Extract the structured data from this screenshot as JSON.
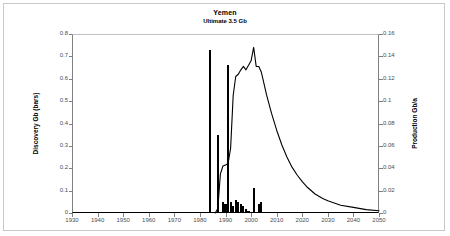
{
  "chart": {
    "title": "Yemen",
    "subtitle": "Ultimate 3.5 Gb",
    "ylabel_left": "Discovery Gb (bars)",
    "ylabel_right": "Production Gb/a"
  },
  "chart_data": {
    "type": "bar",
    "title": "Yemen",
    "subtitle": "Ultimate 3.5 Gb",
    "xlabel": "",
    "ylabel": "Discovery Gb (bars)",
    "ylabel_right": "Production Gb/a",
    "xlim": [
      1930,
      2050
    ],
    "ylim": [
      0,
      0.8
    ],
    "ylim_right": [
      0,
      0.16
    ],
    "xticks": [
      1930,
      1940,
      1950,
      1960,
      1970,
      1980,
      1990,
      2000,
      2010,
      2020,
      2030,
      2040,
      2050
    ],
    "yticks_left": [
      "0",
      "0.1",
      "0.2",
      "0.3",
      "0.4",
      "0.5",
      "0.6",
      "0.7",
      "0.8"
    ],
    "yticks_right": [
      "0",
      "0.02",
      "0.04",
      "0.06",
      "0.08",
      "0.1",
      "0.12",
      "0.14",
      "0.16"
    ],
    "grid": false,
    "legend": "none",
    "series": [
      {
        "name": "Discovery Gb (bars)",
        "type": "bar",
        "axis": "left",
        "color": "#000000",
        "x": [
          1984,
          1985,
          1986,
          1987,
          1988,
          1989,
          1990,
          1991,
          1992,
          1993,
          1994,
          1995,
          1996,
          1997,
          1998,
          1999,
          2000,
          2001,
          2002,
          2003,
          2004,
          2005
        ],
        "values": [
          0.73,
          0.0,
          0.0,
          0.35,
          0.0,
          0.05,
          0.04,
          0.66,
          0.05,
          0.03,
          0.06,
          0.05,
          0.04,
          0.03,
          0.02,
          0.01,
          0.0,
          0.11,
          0.0,
          0.04,
          0.05,
          0.0
        ]
      },
      {
        "name": "Production Gb/a",
        "type": "line",
        "axis": "right",
        "color": "#000000",
        "x": [
          1986,
          1987,
          1988,
          1989,
          1990,
          1991,
          1992,
          1993,
          1994,
          1995,
          1996,
          1997,
          1998,
          1999,
          2000,
          2001,
          2002,
          2003,
          2004,
          2005,
          2006,
          2008,
          2010,
          2012,
          2014,
          2016,
          2018,
          2020,
          2022,
          2025,
          2028,
          2030,
          2035,
          2040,
          2045,
          2050
        ],
        "values": [
          0.0,
          0.004,
          0.035,
          0.042,
          0.043,
          0.044,
          0.058,
          0.105,
          0.122,
          0.124,
          0.128,
          0.131,
          0.128,
          0.132,
          0.136,
          0.148,
          0.131,
          0.131,
          0.126,
          0.116,
          0.106,
          0.089,
          0.074,
          0.061,
          0.05,
          0.041,
          0.034,
          0.028,
          0.023,
          0.017,
          0.013,
          0.011,
          0.007,
          0.005,
          0.003,
          0.002
        ]
      }
    ]
  }
}
